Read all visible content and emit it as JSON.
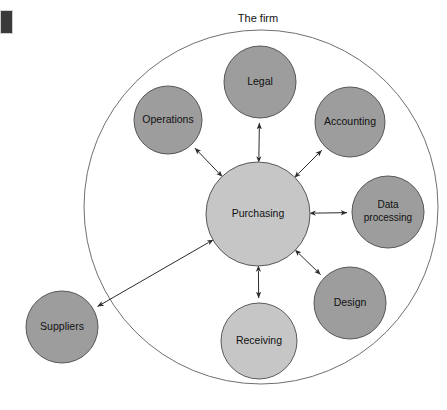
{
  "figure": {
    "title": "The firm",
    "boundary_name": "The firm",
    "colors": {
      "satellite_fill": "#9d9d9d",
      "highlight_fill": "#c6c6c6",
      "boundary_stroke": "#6f6f6f",
      "node_stroke": "#4a4a4a",
      "connector_stroke": "#2b2b2b",
      "marker_block": "#3a3a3a",
      "background": "#ffffff",
      "label_text": "#111111"
    }
  },
  "chart_data": {
    "type": "diagram",
    "title": "The firm",
    "boundary": {
      "label": "The firm",
      "shape": "circle",
      "cx": 261,
      "cy": 207,
      "r": 177
    },
    "nodes": [
      {
        "id": "purchasing",
        "label": "Purchasing",
        "lines": [
          "Purchasing"
        ],
        "cx": 258,
        "cy": 214,
        "r": 52,
        "fill": "#c6c6c6",
        "inside_firm": true
      },
      {
        "id": "legal",
        "label": "Legal",
        "lines": [
          "Legal"
        ],
        "cx": 260,
        "cy": 82,
        "r": 36,
        "fill": "#9d9d9d",
        "inside_firm": true
      },
      {
        "id": "operations",
        "label": "Operations",
        "lines": [
          "Operations"
        ],
        "cx": 168,
        "cy": 120,
        "r": 34,
        "fill": "#9d9d9d",
        "inside_firm": true
      },
      {
        "id": "accounting",
        "label": "Accounting",
        "lines": [
          "Accounting"
        ],
        "cx": 350,
        "cy": 122,
        "r": 35,
        "fill": "#9d9d9d",
        "inside_firm": true
      },
      {
        "id": "data-processing",
        "label": "Data processing",
        "lines": [
          "Data",
          "processing"
        ],
        "cx": 388,
        "cy": 212,
        "r": 36,
        "fill": "#9d9d9d",
        "inside_firm": true
      },
      {
        "id": "design",
        "label": "Design",
        "lines": [
          "Design"
        ],
        "cx": 350,
        "cy": 303,
        "r": 36,
        "fill": "#9d9d9d",
        "inside_firm": true
      },
      {
        "id": "receiving",
        "label": "Receiving",
        "lines": [
          "Receiving"
        ],
        "cx": 259,
        "cy": 341,
        "r": 38,
        "fill": "#c6c6c6",
        "inside_firm": true
      },
      {
        "id": "suppliers",
        "label": "Suppliers",
        "lines": [
          "Suppliers"
        ],
        "cx": 62,
        "cy": 327,
        "r": 36,
        "fill": "#9d9d9d",
        "inside_firm": false
      }
    ],
    "edges": [
      {
        "from": "purchasing",
        "to": "legal",
        "style": "double-arrow"
      },
      {
        "from": "purchasing",
        "to": "operations",
        "style": "double-arrow"
      },
      {
        "from": "purchasing",
        "to": "accounting",
        "style": "double-arrow"
      },
      {
        "from": "purchasing",
        "to": "data-processing",
        "style": "double-arrow"
      },
      {
        "from": "purchasing",
        "to": "design",
        "style": "double-arrow"
      },
      {
        "from": "purchasing",
        "to": "receiving",
        "style": "double-arrow"
      },
      {
        "from": "purchasing",
        "to": "suppliers",
        "style": "double-arrow"
      }
    ]
  }
}
